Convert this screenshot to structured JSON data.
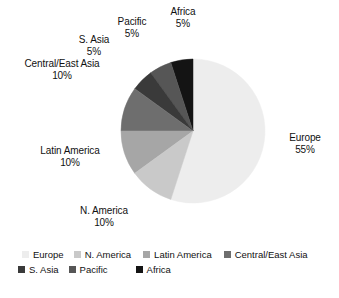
{
  "chart_data": {
    "type": "pie",
    "title": "",
    "categories": [
      "Europe",
      "N. America",
      "Latin America",
      "Central/East Asia",
      "S. Asia",
      "Pacific",
      "Africa"
    ],
    "values": [
      55,
      10,
      10,
      10,
      5,
      5,
      5
    ],
    "unit": "%",
    "legend_position": "bottom",
    "grid": false,
    "start_angle_deg": 0,
    "direction": "counterclockwise",
    "colors": [
      "#ededed",
      "#c9c9c9",
      "#a6a6a6",
      "#6e6e6e",
      "#3a3a3a",
      "#565656",
      "#141414"
    ],
    "slices": [
      {
        "label": "Europe",
        "value": 55,
        "pct_text": "55%",
        "color": "#ededed"
      },
      {
        "label": "N. America",
        "value": 10,
        "pct_text": "10%",
        "color": "#c9c9c9"
      },
      {
        "label": "Latin America",
        "value": 10,
        "pct_text": "10%",
        "color": "#a6a6a6"
      },
      {
        "label": "Central/East Asia",
        "value": 10,
        "pct_text": "10%",
        "color": "#6e6e6e"
      },
      {
        "label": "S. Asia",
        "value": 5,
        "pct_text": "5%",
        "color": "#3a3a3a"
      },
      {
        "label": "Pacific",
        "value": 5,
        "pct_text": "5%",
        "color": "#565656"
      },
      {
        "label": "Africa",
        "value": 5,
        "pct_text": "5%",
        "color": "#141414"
      }
    ]
  },
  "labels": {
    "africa": {
      "name": "Africa",
      "pct": "5%"
    },
    "pacific": {
      "name": "Pacific",
      "pct": "5%"
    },
    "sasia": {
      "name": "S. Asia",
      "pct": "5%"
    },
    "ceasia": {
      "name": "Central/East Asia",
      "pct": "10%"
    },
    "latin": {
      "name": "Latin America",
      "pct": "10%"
    },
    "namerica": {
      "name": "N. America",
      "pct": "10%"
    },
    "europe": {
      "name": "Europe",
      "pct": "55%"
    }
  },
  "legend": {
    "row1": [
      {
        "label": "Europe",
        "color": "#ededed"
      },
      {
        "label": "N. America",
        "color": "#c9c9c9"
      },
      {
        "label": "Latin America",
        "color": "#a6a6a6"
      },
      {
        "label": "Central/East Asia",
        "color": "#6e6e6e"
      }
    ],
    "row2": [
      {
        "label": "S. Asia",
        "color": "#3a3a3a"
      },
      {
        "label": "Pacific",
        "color": "#565656"
      },
      {
        "label": "Africa",
        "color": "#141414"
      }
    ]
  }
}
